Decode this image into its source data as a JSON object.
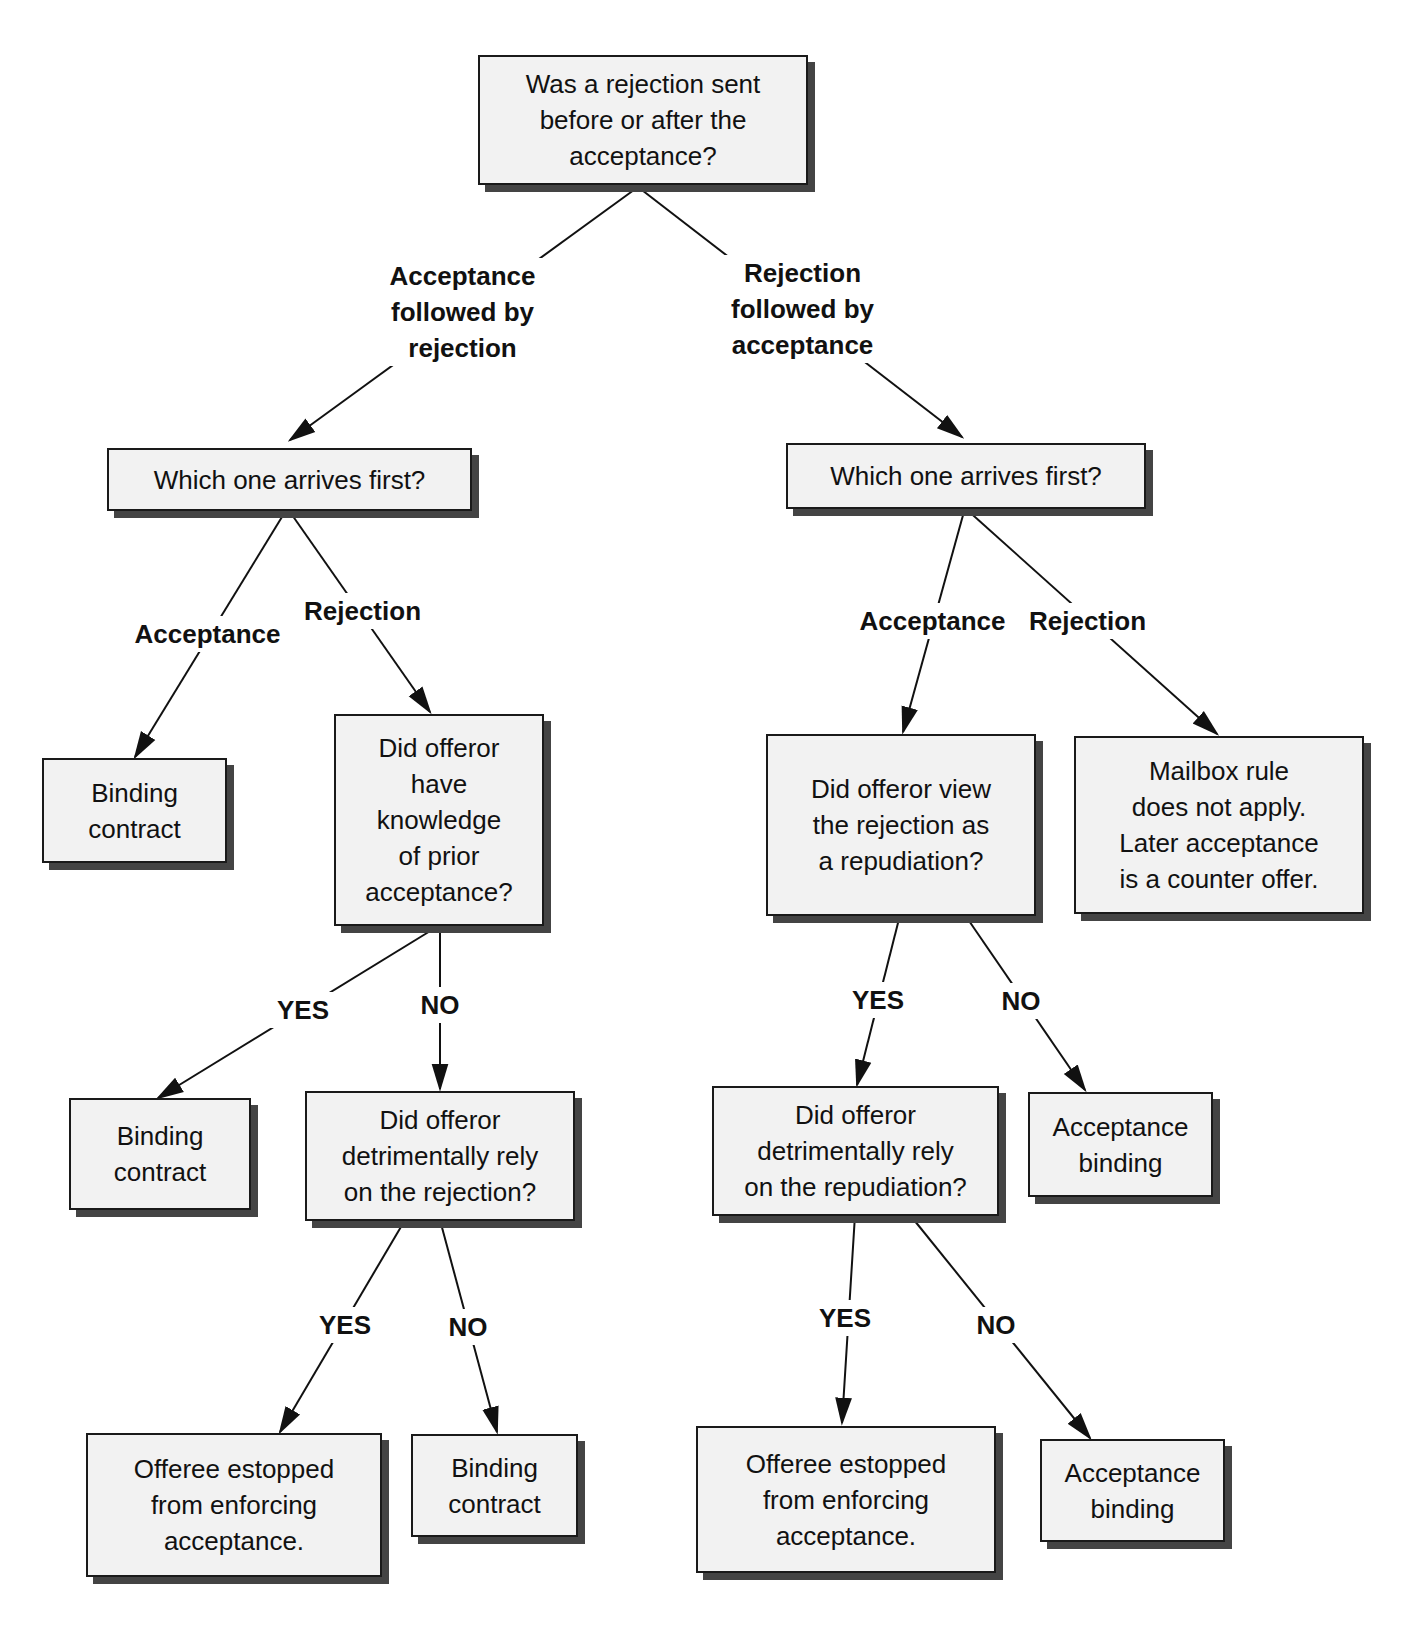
{
  "nodes": {
    "root": "Was a rejection sent\nbefore or after the\nacceptance?",
    "left_q": "Which one arrives first?",
    "right_q": "Which one arrives first?",
    "left_binding1": "Binding\ncontract",
    "knowledge_q": "Did offeror\nhave\nknowledge\nof prior\nacceptance?",
    "left_binding2": "Binding\ncontract",
    "rely_rejection_q": "Did offeror\ndetrimentally rely\non the rejection?",
    "left_estopped": "Offeree estopped\nfrom enforcing\nacceptance.",
    "left_binding3": "Binding\ncontract",
    "repudiation_q": "Did offeror view\nthe rejection as\na repudiation?",
    "mailbox": "Mailbox rule\ndoes not apply.\nLater acceptance\nis a counter offer.",
    "rely_repudiation_q": "Did offeror\ndetrimentally rely\non the repudiation?",
    "right_accept_binding1": "Acceptance\nbinding",
    "right_estopped": "Offeree estopped\nfrom enforcing\nacceptance.",
    "right_accept_binding2": "Acceptance\nbinding"
  },
  "labels": {
    "accept_then_reject": "Acceptance\nfollowed by\nrejection",
    "reject_then_accept": "Rejection\nfollowed by\nacceptance",
    "left_acceptance": "Acceptance",
    "left_rejection": "Rejection",
    "right_acceptance": "Acceptance",
    "right_rejection": "Rejection",
    "knowledge_yes": "YES",
    "knowledge_no": "NO",
    "rely_rej_yes": "YES",
    "rely_rej_no": "NO",
    "repud_yes": "YES",
    "repud_no": "NO",
    "rely_repud_yes": "YES",
    "rely_repud_no": "NO"
  }
}
